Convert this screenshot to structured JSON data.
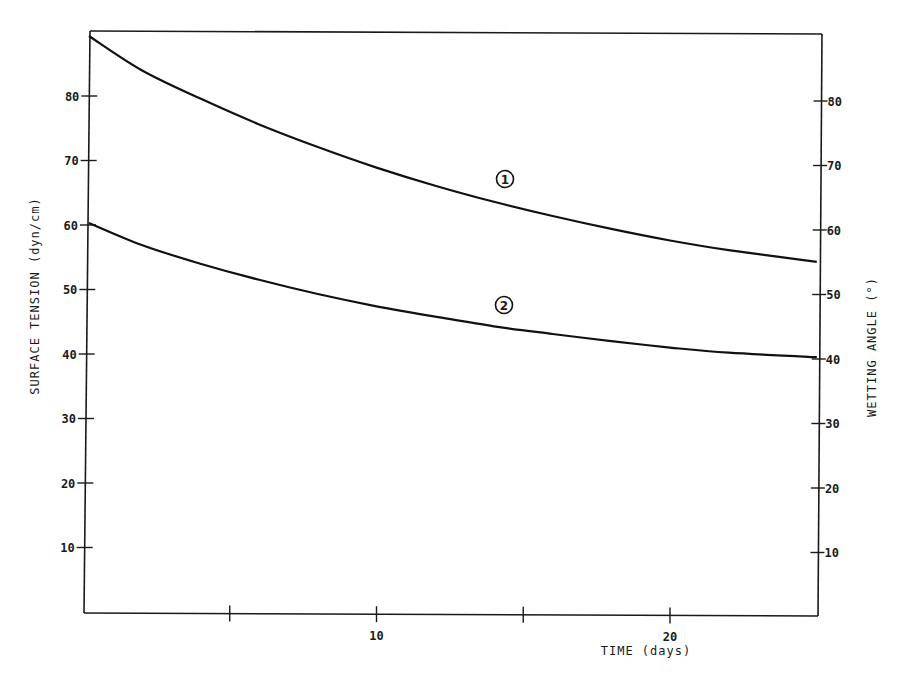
{
  "chart_data": {
    "type": "line",
    "title": "",
    "xlabel": "TIME (days)",
    "ylabel": "SURFACE TENSION (dyn/cm)",
    "ylabel_right": "WETTING ANGLE (°)",
    "xlim": [
      0,
      25
    ],
    "ylim": [
      0,
      90
    ],
    "ylim_right": [
      0,
      90
    ],
    "grid": false,
    "legend": "inline circled numbers on curves",
    "x_ticks": [
      5,
      10,
      15,
      20
    ],
    "x_tick_labels": [
      "",
      "10",
      "",
      "20"
    ],
    "y_ticks": [
      10,
      20,
      30,
      40,
      50,
      60,
      70,
      80
    ],
    "y_tick_labels": [
      "10",
      "20",
      "30",
      "40",
      "50",
      "60",
      "70",
      "80"
    ],
    "y_right_ticks": [
      10,
      20,
      30,
      40,
      50,
      60,
      70,
      80
    ],
    "y_right_tick_labels": [
      "10",
      "20",
      "30",
      "40",
      "50",
      "60",
      "70",
      "80"
    ],
    "x": [
      0,
      2,
      4,
      6,
      8,
      10,
      12,
      14,
      16,
      18,
      20,
      22,
      25
    ],
    "series": [
      {
        "name": "1",
        "label_position_x": 14.6,
        "values": [
          89.3,
          84.0,
          79.6,
          75.6,
          72.1,
          68.9,
          66.1,
          63.6,
          61.4,
          59.4,
          57.6,
          56.1,
          54.3
        ]
      },
      {
        "name": "2",
        "label_position_x": 14.6,
        "values": [
          60.3,
          56.9,
          54.0,
          51.5,
          49.3,
          47.4,
          45.8,
          44.3,
          43.1,
          42.0,
          41.0,
          40.2,
          39.5
        ]
      }
    ]
  },
  "labels": {
    "x_axis_title": "TIME (days)",
    "y_axis_title": "SURFACE TENSION (dyn/cm)",
    "y_right_axis_title": "WETTING ANGLE (°)",
    "curve1_marker": "1",
    "curve2_marker": "2"
  }
}
